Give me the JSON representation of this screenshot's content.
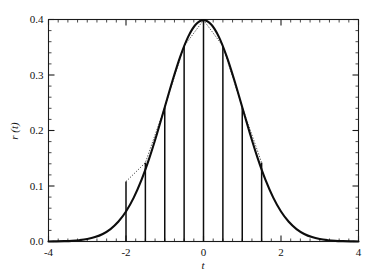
{
  "chart_data": {
    "type": "line",
    "title": "",
    "subtitle": "",
    "xlabel": "t",
    "ylabel": "r (t)",
    "xlim": [
      -4,
      4
    ],
    "ylim": [
      0.0,
      0.4
    ],
    "grid": false,
    "legend": null,
    "x_ticks": [
      -4,
      -2,
      0,
      2,
      4
    ],
    "x_tick_labels": [
      "-4",
      "-2",
      "0",
      "2",
      "4"
    ],
    "y_ticks": [
      0.0,
      0.1,
      0.2,
      0.3,
      0.4
    ],
    "y_tick_labels": [
      "0.0",
      "0.1",
      "0.2",
      "0.3",
      "0.4"
    ],
    "x_minor_step": 0.25,
    "y_minor_step": 0.02,
    "series": [
      {
        "name": "r(t)",
        "style": "solid-curve",
        "color": "#0d0d0d",
        "description": "Gaussian pulse r(t) = 0.4 exp(-t^2/2)",
        "x": [
          -4.0,
          -3.8,
          -3.6,
          -3.4,
          -3.2,
          -3.0,
          -2.8,
          -2.6,
          -2.4,
          -2.2,
          -2.0,
          -1.8,
          -1.6,
          -1.4,
          -1.2,
          -1.0,
          -0.8,
          -0.6,
          -0.4,
          -0.2,
          0.0,
          0.2,
          0.4,
          0.6,
          0.8,
          1.0,
          1.2,
          1.4,
          1.6,
          1.8,
          2.0,
          2.2,
          2.4,
          2.6,
          2.8,
          3.0,
          3.2,
          3.4,
          3.6,
          3.8,
          4.0
        ],
        "y": [
          0.0001,
          0.0003,
          0.0006,
          0.0012,
          0.0024,
          0.0044,
          0.0079,
          0.0136,
          0.0224,
          0.0355,
          0.054,
          0.079,
          0.1109,
          0.1497,
          0.1942,
          0.242,
          0.2897,
          0.3332,
          0.3683,
          0.391,
          0.3989,
          0.391,
          0.3683,
          0.3332,
          0.2897,
          0.242,
          0.1942,
          0.1497,
          0.1109,
          0.079,
          0.054,
          0.0355,
          0.0224,
          0.0136,
          0.0079,
          0.0044,
          0.0024,
          0.0012,
          0.0006,
          0.0003,
          0.0001
        ]
      },
      {
        "name": "samples",
        "style": "impulses",
        "color": "#0d0d0d",
        "description": "Vertical impulse lines (sampled values) at sample instants",
        "x": [
          -2.0,
          -1.5,
          -1.0,
          -0.5,
          0.0,
          0.5,
          1.0,
          1.5
        ],
        "y": [
          0.108,
          0.142,
          0.242,
          0.3521,
          0.3989,
          0.3521,
          0.242,
          0.142
        ]
      },
      {
        "name": "interpolation",
        "style": "dotted",
        "color": "#4a4a4a",
        "description": "Dotted straight-line interpolation joining impulse tops",
        "x": [
          -2.0,
          -1.5,
          -1.0,
          -0.5,
          0.0,
          0.5,
          1.0,
          1.5
        ],
        "y": [
          0.108,
          0.142,
          0.242,
          0.3521,
          0.3989,
          0.3521,
          0.242,
          0.142
        ]
      }
    ]
  },
  "axes": {
    "x_title": "t",
    "y_title": "r (t)"
  }
}
